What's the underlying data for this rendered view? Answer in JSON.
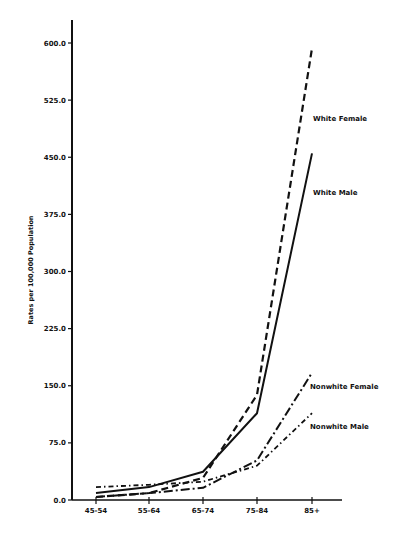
{
  "chart_data": {
    "type": "line",
    "title": "",
    "xlabel": "",
    "ylabel": "Rates per 100,000 Population",
    "categories": [
      "45-54",
      "55-64",
      "65-74",
      "75-84",
      "85+"
    ],
    "yticks": [
      "0.0",
      "75.0",
      "150.0",
      "225.0",
      "300.0",
      "375.0",
      "450.0",
      "525.0",
      "600.0"
    ],
    "ylim": [
      0,
      620
    ],
    "grid": false,
    "legend_position": "inline labels at line ends",
    "series": [
      {
        "name": "White Female",
        "style": "dashed",
        "values": [
          4,
          9,
          29,
          138,
          593
        ]
      },
      {
        "name": "White Male",
        "style": "solid",
        "values": [
          9,
          17,
          37,
          114,
          455
        ]
      },
      {
        "name": "Nonwhite Female",
        "style": "long-dash-dot",
        "values": [
          4,
          9,
          16,
          52,
          167
        ]
      },
      {
        "name": "Nonwhite Male",
        "style": "dash-dot",
        "values": [
          17,
          20,
          24,
          45,
          114
        ]
      }
    ]
  },
  "colors": {
    "ink": "#111111",
    "background": "#ffffff"
  }
}
